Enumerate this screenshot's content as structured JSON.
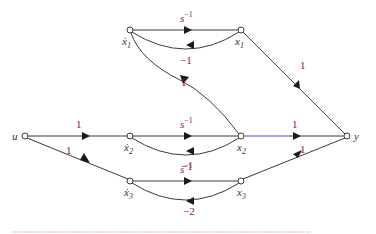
{
  "diagram": {
    "type": "signal-flow-graph",
    "nodes": {
      "u": {
        "label": "u"
      },
      "x1dot": {
        "label": "ẋ",
        "sub": "1"
      },
      "x1": {
        "label": "x",
        "sub": "1"
      },
      "x2dot": {
        "label": "ẋ",
        "sub": "2"
      },
      "x2": {
        "label": "x",
        "sub": "2"
      },
      "x3dot": {
        "label": "ẋ",
        "sub": "3"
      },
      "x3": {
        "label": "x",
        "sub": "3"
      },
      "y": {
        "label": "y"
      }
    },
    "edges": [
      {
        "id": "u_x2dot",
        "from": "u",
        "to": "x2dot",
        "gain": "1"
      },
      {
        "id": "u_x3dot",
        "from": "u",
        "to": "x3dot",
        "gain": "1"
      },
      {
        "id": "x1dot_x1",
        "from": "x1dot",
        "to": "x1",
        "gain_base": "s",
        "gain_exp": "−1"
      },
      {
        "id": "x1_x1dot",
        "from": "x1",
        "to": "x1dot",
        "gain": "−1"
      },
      {
        "id": "x2dot_x2",
        "from": "x2dot",
        "to": "x2",
        "gain_base": "s",
        "gain_exp": "−1"
      },
      {
        "id": "x2_x2dot",
        "from": "x2",
        "to": "x2dot",
        "gain": "−1"
      },
      {
        "id": "x2_x1dot",
        "from": "x2",
        "to": "x1dot",
        "gain": "1"
      },
      {
        "id": "x3dot_x3",
        "from": "x3dot",
        "to": "x3",
        "gain_base": "s",
        "gain_exp": "−1"
      },
      {
        "id": "x3_x3dot",
        "from": "x3",
        "to": "x3dot",
        "gain": "−2"
      },
      {
        "id": "x1_y",
        "from": "x1",
        "to": "y",
        "gain": "1"
      },
      {
        "id": "x2_y",
        "from": "x2",
        "to": "y",
        "gain": "1"
      },
      {
        "id": "x3_y",
        "from": "x3",
        "to": "y",
        "gain": "1"
      }
    ],
    "colors": {
      "edge": "#3a3a3a",
      "highlight_edge": "#4a4ad0",
      "gain_text": "#8a2040",
      "divider": "#d88a9a"
    }
  }
}
